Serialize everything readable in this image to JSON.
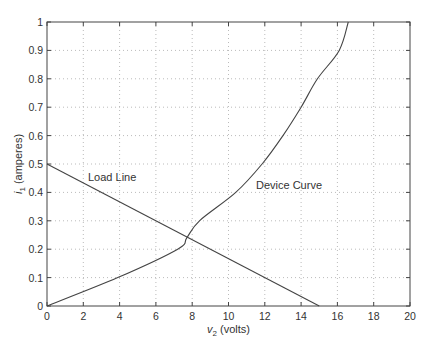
{
  "chart_data": {
    "type": "line",
    "title": "",
    "xlabel": "v2 (volts)",
    "xlabel_main": "v",
    "xlabel_sub": "2",
    "xlabel_rest": " (volts)",
    "ylabel": "i1 (amperes)",
    "ylabel_main": "i",
    "ylabel_sub": "1",
    "ylabel_rest": " (amperes)",
    "xlim": [
      0,
      20
    ],
    "ylim": [
      0,
      1
    ],
    "grid": true,
    "x_ticks": [
      "0",
      "2",
      "4",
      "6",
      "8",
      "10",
      "12",
      "14",
      "16",
      "18",
      "20"
    ],
    "y_ticks": [
      "0",
      "0.1",
      "0.2",
      "0.3",
      "0.4",
      "0.5",
      "0.6",
      "0.7",
      "0.8",
      "0.9",
      "1"
    ],
    "series": [
      {
        "name": "Load Line",
        "x": [
          0,
          15
        ],
        "y": [
          0.5,
          0
        ]
      },
      {
        "name": "Device Curve",
        "x": [
          0,
          3.9,
          7.2,
          7.7,
          8.4,
          10.4,
          11.85,
          13.0,
          14.0,
          14.9,
          16.1,
          16.6
        ],
        "y": [
          0,
          0.1,
          0.2,
          0.24,
          0.3,
          0.4,
          0.5,
          0.6,
          0.7,
          0.8,
          0.9,
          1.0
        ]
      }
    ],
    "annotations": [
      {
        "text": "Load Line",
        "x": 2.3,
        "y": 0.45
      },
      {
        "text": "Device Curve",
        "x": 11.5,
        "y": 0.42
      }
    ],
    "line_color": "#444444",
    "grid_color": "#bbbbbb"
  }
}
